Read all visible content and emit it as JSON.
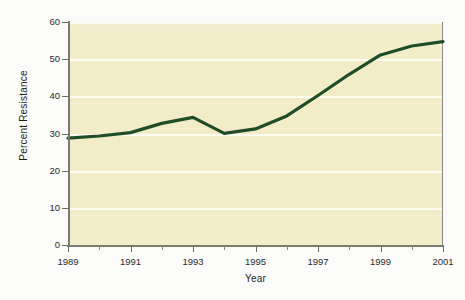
{
  "figure": {
    "background_color": "#fbfbf9",
    "plot_background_color": "#f2edc8",
    "gridline_color": "#fdfdf4",
    "axis_color": "#7d7b70",
    "line_color": "#1f4d28"
  },
  "chart_data": {
    "type": "line",
    "title": "",
    "xlabel": "Year",
    "ylabel": "Percent Resistance",
    "xlim": [
      1989,
      2001
    ],
    "ylim": [
      0,
      60
    ],
    "grid": true,
    "legend": "none",
    "y_ticks": [
      0,
      10,
      20,
      30,
      40,
      50,
      60
    ],
    "y_tick_labels": [
      "0",
      "10",
      "20",
      "30",
      "40",
      "50",
      "60"
    ],
    "x_ticks": [
      1989,
      1991,
      1993,
      1995,
      1997,
      1999,
      2001
    ],
    "x_tick_labels": [
      "1989",
      "1991",
      "1993",
      "1995",
      "1997",
      "1999",
      "2001"
    ],
    "x_minor_ticks": [
      1990,
      1992,
      1994,
      1996,
      1998,
      2000
    ],
    "x": [
      1989,
      1990,
      1991,
      1992,
      1993,
      1994,
      1995,
      1996,
      1997,
      1998,
      1999,
      2000,
      2001
    ],
    "series": [
      {
        "name": "Percent Resistance",
        "color": "#1f4d28",
        "line_width": 3.2,
        "values": [
          29.0,
          29.6,
          30.5,
          33.0,
          34.6,
          30.3,
          31.5,
          35.0,
          40.5,
          46.2,
          51.4,
          53.8,
          55.0
        ]
      }
    ]
  }
}
